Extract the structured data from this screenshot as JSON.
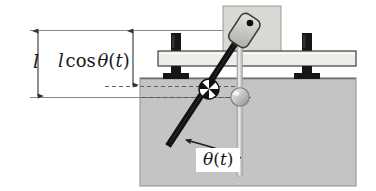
{
  "figure": {
    "type": "mechanical-schematic",
    "background_color": "#ffffff",
    "ground_fill_color": "#c6c6c6",
    "ground_edge_color": "#5a5a5a",
    "bar_fill_color": "#e8e8e4",
    "bar_edge_color": "#4a4a4a",
    "block_fill_color": "#d6d6d2",
    "block_edge_color": "#6a6a6a",
    "bolt_color": "#161616",
    "rod_color": "#111111",
    "vertical_rod_color": "#dcdcdc",
    "sphere_gray_color": "#bdbdbd",
    "dimension_line_color": "#333333",
    "dashed_line_color": "#555555"
  },
  "labels": {
    "length": {
      "name": "length-label",
      "symbol": "l",
      "text": "l"
    },
    "projected_length": {
      "name": "projected-length-label",
      "symbol": "l cos",
      "function": "cos",
      "variable": "θ(t)",
      "text": "l cos θ(t)"
    },
    "angle": {
      "name": "angle-label",
      "variable": "θ",
      "argument": "(t)",
      "text": "θ(t)"
    }
  },
  "dimensions": [
    {
      "name": "full-length-dimension",
      "label": "l",
      "x": 38,
      "y_top": 30,
      "y_bottom": 97,
      "arrowheads": "both"
    },
    {
      "name": "projected-length-dimension",
      "label": "l cos θ(t)",
      "x": 133,
      "y_top": 30,
      "y_bottom": 86,
      "arrowheads": "both"
    }
  ],
  "reference_lines": [
    {
      "name": "top-reference-line",
      "y": 30,
      "x_start": 30,
      "x_end": 240,
      "style": "solid"
    },
    {
      "name": "pivot-reference-line",
      "y": 97,
      "x_start": 30,
      "x_end": 245,
      "style": "solid"
    },
    {
      "name": "mass-dashed-line",
      "y": 86,
      "x_start": 105,
      "x_end": 245,
      "style": "dashed"
    },
    {
      "name": "lower-dashed-line",
      "y": 97,
      "x_start": 140,
      "x_end": 250,
      "style": "dashed"
    }
  ],
  "parts": [
    {
      "name": "ground-region",
      "shape": "rectangle",
      "x": 140,
      "y": 78,
      "width": 216,
      "height": 108
    },
    {
      "name": "support-bar",
      "shape": "rectangle",
      "x": 158,
      "y": 51,
      "width": 198,
      "height": 15
    },
    {
      "name": "upper-block",
      "shape": "rectangle",
      "x": 223,
      "y": 6,
      "width": 58,
      "height": 48
    },
    {
      "name": "left-bolt-post",
      "shape": "post",
      "x": 176,
      "y": 33
    },
    {
      "name": "left-bolt-foot",
      "shape": "t-foot",
      "x": 176,
      "y": 66
    },
    {
      "name": "right-bolt-post",
      "shape": "post",
      "x": 307,
      "y": 33
    },
    {
      "name": "right-bolt-foot",
      "shape": "t-foot",
      "x": 307,
      "y": 66
    },
    {
      "name": "pendulum-rod",
      "shape": "line",
      "x1": 247,
      "y1": 26,
      "x2": 168,
      "y2": 146
    },
    {
      "name": "pivot-pad",
      "shape": "rounded-rectangle",
      "cx": 245,
      "cy": 27,
      "rotation_deg": 33
    },
    {
      "name": "pivot-dot",
      "shape": "dot",
      "cx": 249,
      "cy": 23
    },
    {
      "name": "mass-sphere",
      "shape": "quartered-sphere",
      "cx": 209,
      "cy": 89,
      "r": 10
    },
    {
      "name": "slider-sphere",
      "shape": "shaded-sphere",
      "cx": 240,
      "cy": 97,
      "r": 9
    },
    {
      "name": "vertical-rod",
      "shape": "line",
      "x1": 240,
      "y1": 30,
      "x2": 240,
      "y2": 176
    },
    {
      "name": "angle-arc-arrow",
      "shape": "arc",
      "from": "vertical-rod",
      "to": "pendulum-rod"
    }
  ]
}
